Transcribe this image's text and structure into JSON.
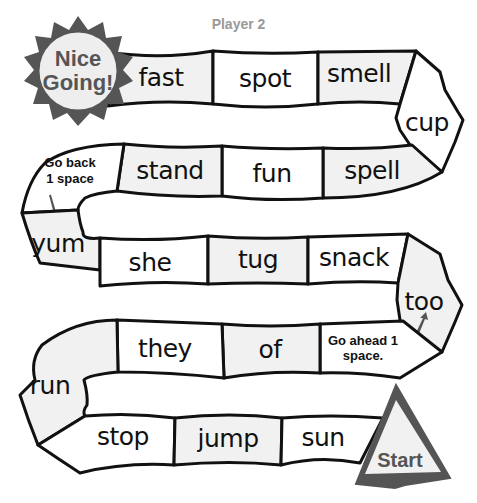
{
  "header": {
    "player_label": "Player 2"
  },
  "finish": {
    "line1": "Nice",
    "line2": "Going!"
  },
  "start": {
    "label": "Start"
  },
  "spaces": {
    "fast": "fast",
    "spot": "spot",
    "smell": "smell",
    "cup": "cup",
    "spell": "spell",
    "fun": "fun",
    "stand": "stand",
    "go_back_line1": "Go back",
    "go_back_line2": "1 space",
    "yum": "yum",
    "she": "she",
    "tug": "tug",
    "snack": "snack",
    "too": "too",
    "go_ahead_line1": "Go ahead 1",
    "go_ahead_line2": "space.",
    "of": "of",
    "they": "they",
    "run": "run",
    "stop": "stop",
    "jump": "jump",
    "sun": "sun"
  },
  "path_order": [
    "Start",
    "sun",
    "jump",
    "stop",
    "run",
    "they",
    "of",
    "Go ahead 1 space.",
    "too",
    "snack",
    "tug",
    "she",
    "yum",
    "Go back 1 space",
    "stand",
    "fun",
    "spell",
    "cup",
    "smell",
    "spot",
    "fast",
    "Nice Going!"
  ],
  "colors": {
    "outline": "#111111",
    "badge": "#555555",
    "shaded_space": "#f1f1f1",
    "player_label": "#999999"
  }
}
